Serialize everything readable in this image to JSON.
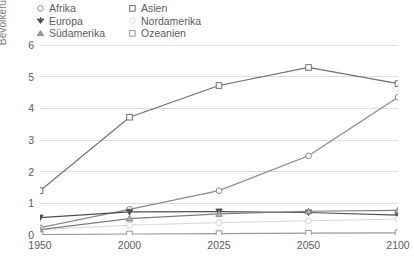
{
  "chart_data": {
    "type": "line",
    "title": "",
    "subtitle": "",
    "xlabel": "",
    "ylabel": "Bevölkerung in Milliarden",
    "x": [
      1950,
      2000,
      2025,
      2050,
      2100
    ],
    "xticklabels": [
      "1950",
      "2000",
      "2025",
      "2050",
      "2100"
    ],
    "yticklabels": [
      "0",
      "1",
      "2",
      "3",
      "4",
      "5",
      "6"
    ],
    "yticks": [
      0,
      1,
      2,
      3,
      4,
      5,
      6
    ],
    "ylim": [
      0,
      6
    ],
    "grid": "horizontal",
    "legend_position": "top-left",
    "series": [
      {
        "name": "Afrika",
        "marker": "circle",
        "color": "#8a8a8a",
        "values": [
          0.23,
          0.81,
          1.4,
          2.5,
          4.35
        ]
      },
      {
        "name": "Asien",
        "marker": "square",
        "color": "#6f6f6f",
        "values": [
          1.4,
          3.72,
          4.72,
          5.29,
          4.78
        ]
      },
      {
        "name": "Europa",
        "marker": "triangle-down",
        "color": "#4f4f4f",
        "values": [
          0.55,
          0.73,
          0.74,
          0.71,
          0.63
        ]
      },
      {
        "name": "Nordamerika",
        "marker": "circle-faint",
        "color": "#d6d6d6",
        "values": [
          0.17,
          0.31,
          0.39,
          0.45,
          0.5
        ]
      },
      {
        "name": "Südamerika",
        "marker": "triangle-up",
        "color": "#7d7d7d",
        "values": [
          0.17,
          0.52,
          0.67,
          0.75,
          0.78
        ]
      },
      {
        "name": "Ozeanien",
        "marker": "square",
        "color": "#9a9a9a",
        "values": [
          0.013,
          0.031,
          0.045,
          0.057,
          0.07
        ]
      }
    ]
  },
  "legend": {
    "items": [
      {
        "label": "Afrika",
        "marker": "circle-icon"
      },
      {
        "label": "Asien",
        "marker": "square-icon"
      },
      {
        "label": "Europa",
        "marker": "triangle-down-icon"
      },
      {
        "label": "Nordamerika",
        "marker": "circle-faint-icon"
      },
      {
        "label": "Südamerika",
        "marker": "triangle-up-icon"
      },
      {
        "label": "Ozeanien",
        "marker": "square-icon"
      }
    ]
  },
  "colors": {
    "background": "#ffffff",
    "gridline": "#d9d9d9",
    "axis": "#9a9a9a",
    "text": "#5c5c5c",
    "axis_label": "#7a7a7a"
  }
}
